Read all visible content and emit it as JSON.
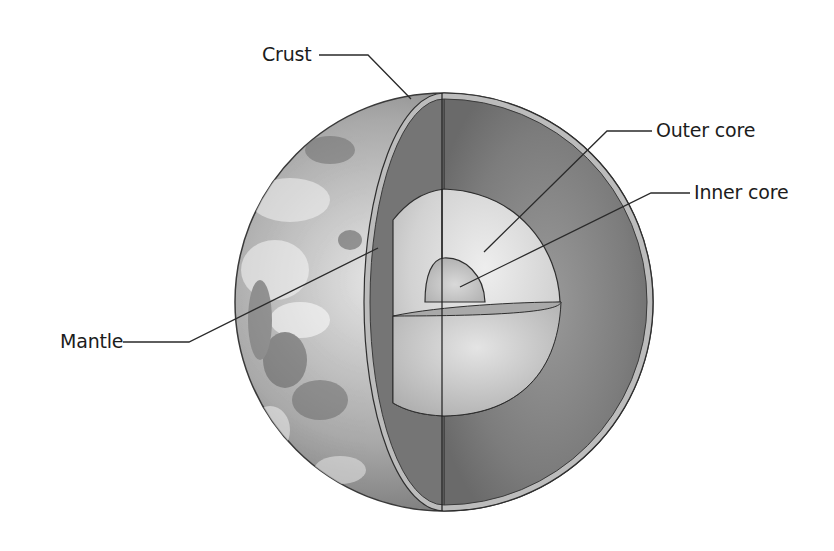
{
  "diagram": {
    "labels": [
      {
        "id": "crust",
        "text": "Crust"
      },
      {
        "id": "outer_core",
        "text": "Outer core"
      },
      {
        "id": "inner_core",
        "text": "Inner core"
      },
      {
        "id": "mantle",
        "text": "Mantle"
      }
    ],
    "colors": {
      "background": "#ffffff",
      "surface_dark": "#6f6f6f",
      "surface_light": "#e8e8e8",
      "mantle": "#7a7a7a",
      "crust_rim": "#b5b5b5",
      "outer_core": "#d6d6d6",
      "inner_core": "#c4c4c4",
      "outline": "#2a2a2a",
      "leader_line": "#2a2a2a"
    }
  }
}
